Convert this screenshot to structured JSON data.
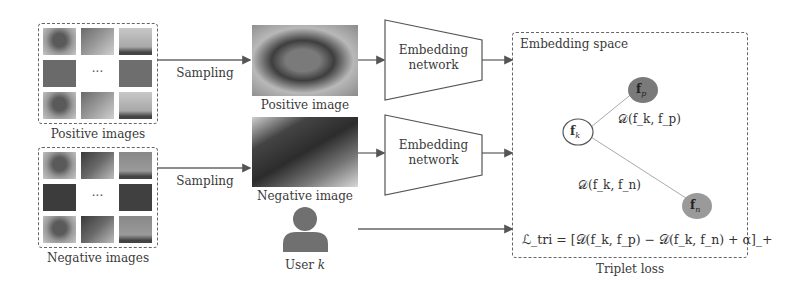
{
  "positive_set": {
    "label": "Positive images",
    "ellipsis": "···"
  },
  "negative_set": {
    "label": "Negative images",
    "ellipsis": "···"
  },
  "sampling": {
    "top_label": "Sampling",
    "bottom_label": "Sampling"
  },
  "positive_image": {
    "label": "Positive image"
  },
  "negative_image": {
    "label": "Negative image"
  },
  "user": {
    "label_prefix": "User ",
    "label_var": "k"
  },
  "embedding_network_top": {
    "line1": "Embedding",
    "line2": "network"
  },
  "embedding_network_bottom": {
    "line1": "Embedding",
    "line2": "network"
  },
  "embedding_space": {
    "title": "Embedding space",
    "anchor_node": {
      "sym": "f",
      "sub": "k",
      "fill": "#ffffff"
    },
    "positive_node": {
      "sym": "f",
      "sub": "p",
      "fill": "#777777"
    },
    "negative_node": {
      "sym": "f",
      "sub": "n",
      "fill": "#999999"
    },
    "dist_pos": "𝒟(f_k, f_p)",
    "dist_neg": "𝒟(f_k, f_n)",
    "loss_formula": "ℒ_tri = [𝒟(f_k, f_p) − 𝒟(f_k, f_n) + α]_+"
  },
  "triplet_loss": {
    "label": "Triplet loss"
  },
  "colors": {
    "arrow": "#555555",
    "border": "#666666",
    "text": "#333333",
    "node_positive": "#777777",
    "node_negative": "#999999",
    "user_icon": "#707070"
  }
}
